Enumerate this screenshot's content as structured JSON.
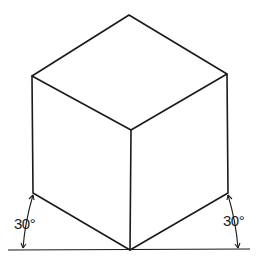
{
  "figure": {
    "angle_labels": {
      "left": "30°",
      "right": "30°"
    },
    "vertices": {
      "top": [
        129,
        15
      ],
      "left_top": [
        32,
        76
      ],
      "right_top": [
        227,
        74
      ],
      "center": [
        131,
        130
      ],
      "left_bottom": [
        33,
        193
      ],
      "right_bottom": [
        228,
        193
      ],
      "bottom": [
        130,
        250
      ]
    },
    "ground_line": {
      "x1": 8,
      "x2": 250,
      "y": 250
    },
    "colors": {
      "line": "#1a1a1a",
      "background": "#ffffff"
    }
  }
}
